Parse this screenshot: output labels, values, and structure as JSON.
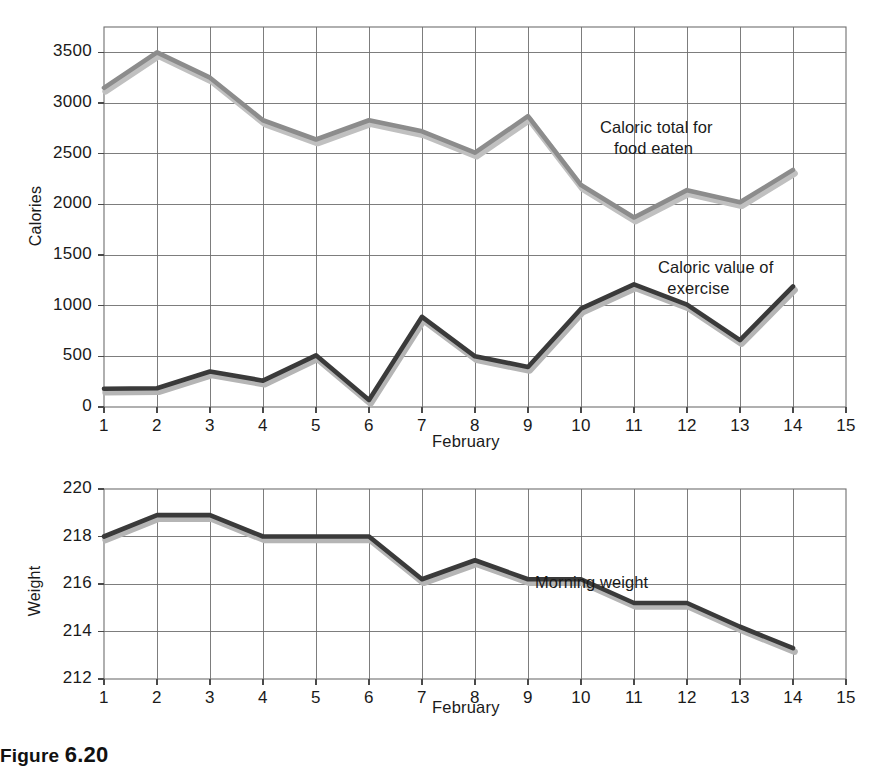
{
  "figure": {
    "caption_number": "6.20",
    "caption_prefix": "Figure"
  },
  "chart_data": [
    {
      "id": "calories-chart",
      "type": "line",
      "title": "",
      "xlabel": "February",
      "ylabel": "Calories",
      "xlim": [
        1,
        15
      ],
      "ylim": [
        0,
        3750
      ],
      "yticks": [
        0,
        500,
        1000,
        1500,
        2000,
        2500,
        3000,
        3500
      ],
      "ytick_labels": [
        "0",
        "500",
        "1000",
        "1500",
        "2000",
        "2500",
        "3000",
        "3500"
      ],
      "xticks": [
        1,
        2,
        3,
        4,
        5,
        6,
        7,
        8,
        9,
        10,
        11,
        12,
        13,
        14,
        15
      ],
      "xtick_labels": [
        "1",
        "2",
        "3",
        "4",
        "5",
        "6",
        "7",
        "8",
        "9",
        "10",
        "11",
        "12",
        "13",
        "14",
        "15"
      ],
      "grid": true,
      "legend_position": "inline-annotations",
      "x": [
        1,
        2,
        3,
        4,
        5,
        6,
        7,
        8,
        9,
        10,
        11,
        12,
        13,
        14
      ],
      "series": [
        {
          "name": "Caloric total for food eaten",
          "color": "#8c8c8c",
          "shadow_color": "#c0c0c0",
          "values": [
            3150,
            3500,
            3250,
            2830,
            2640,
            2830,
            2720,
            2510,
            2870,
            2190,
            1870,
            2140,
            2020,
            2340
          ],
          "annotation": "Caloric total for\n   food eaten"
        },
        {
          "name": "Caloric value of exercise",
          "color": "#3a3a3a",
          "shadow_color": "#b5b5b5",
          "values": [
            180,
            185,
            350,
            260,
            510,
            70,
            890,
            500,
            395,
            970,
            1210,
            1010,
            660,
            1190
          ],
          "annotation": "Caloric value of\n  exercise"
        }
      ]
    },
    {
      "id": "weight-chart",
      "type": "line",
      "title": "",
      "xlabel": "February",
      "ylabel": "Weight",
      "xlim": [
        1,
        15
      ],
      "ylim": [
        212,
        220
      ],
      "yticks": [
        212,
        214,
        216,
        218,
        220
      ],
      "ytick_labels": [
        "212",
        "214",
        "216",
        "218",
        "220"
      ],
      "xticks": [
        1,
        2,
        3,
        4,
        5,
        6,
        7,
        8,
        9,
        10,
        11,
        12,
        13,
        14,
        15
      ],
      "xtick_labels": [
        "1",
        "2",
        "3",
        "4",
        "5",
        "6",
        "7",
        "8",
        "9",
        "10",
        "11",
        "12",
        "13",
        "14",
        "15"
      ],
      "grid": true,
      "legend_position": "inline-annotations",
      "x": [
        1,
        2,
        3,
        4,
        5,
        6,
        7,
        8,
        9,
        10,
        11,
        12,
        13,
        14
      ],
      "series": [
        {
          "name": "Morning weight",
          "color": "#3a3a3a",
          "shadow_color": "#b5b5b5",
          "values": [
            218.0,
            218.9,
            218.9,
            218.0,
            218.0,
            218.0,
            216.2,
            217.0,
            216.2,
            216.2,
            215.2,
            215.2,
            214.2,
            213.3
          ],
          "annotation": "Morning weight"
        }
      ]
    }
  ]
}
